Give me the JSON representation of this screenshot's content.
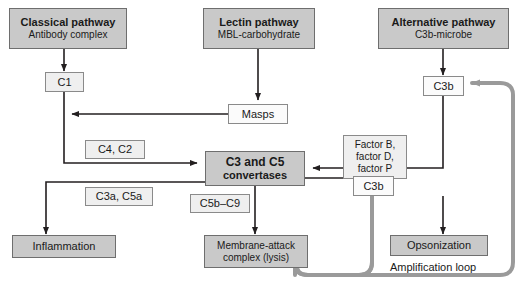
{
  "nodes": {
    "classical_pathway": {
      "heading": "Classical pathway",
      "sub": "Antibody complex"
    },
    "lectin_pathway": {
      "heading": "Lectin pathway",
      "sub": "MBL-carbohydrate"
    },
    "alternative_pathway": {
      "heading": "Alternative pathway",
      "sub": "C3b-microbe"
    },
    "c1": {
      "label": "C1"
    },
    "masps": {
      "label": "Masps"
    },
    "c3b_top": {
      "label": "C3b"
    },
    "c3b_lower": {
      "label": "C3b"
    },
    "factors": {
      "line1": "Factor B,",
      "line2": "factor D,",
      "line3": "factor P"
    },
    "convertases": {
      "line1": "C3 and C5",
      "line2": "convertases"
    },
    "c4_c2": {
      "label": "C4, C2"
    },
    "c3a_c5a": {
      "label": "C3a, C5a"
    },
    "c5b_c9": {
      "label": "C5b–C9"
    },
    "inflammation": {
      "label": "Inflammation"
    },
    "mac": {
      "line1": "Membrane-attack",
      "line2": "complex (lysis)"
    },
    "opsonization": {
      "label": "Opsonization"
    },
    "amplification_loop": {
      "label": "Amplification loop"
    }
  },
  "colors": {
    "shaded_fill": "#c9c9c9",
    "light_fill": "#efefef",
    "white_fill": "#fbfbfb",
    "border": "#8a8a8a",
    "arrow": "#231f20",
    "loop": "#9a9a9a",
    "text": "#1a1a1a"
  }
}
